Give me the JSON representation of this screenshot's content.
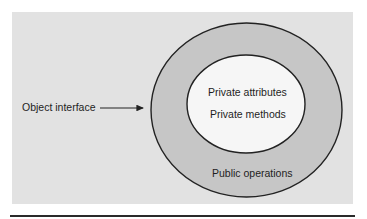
{
  "diagram": {
    "type": "nested-ellipses",
    "labels": {
      "object_interface": "Object interface",
      "private_attributes": "Private attributes",
      "private_methods": "Private methods",
      "public_operations": "Public operations"
    },
    "colors": {
      "panel_background": "#e2e2e2",
      "outer_ring": "#c6c6c6",
      "inner_core": "#f6f6f6",
      "stroke": "#222222"
    },
    "edges": [
      {
        "from": "object_interface",
        "to": "outer_ring",
        "style": "arrow"
      }
    ]
  }
}
